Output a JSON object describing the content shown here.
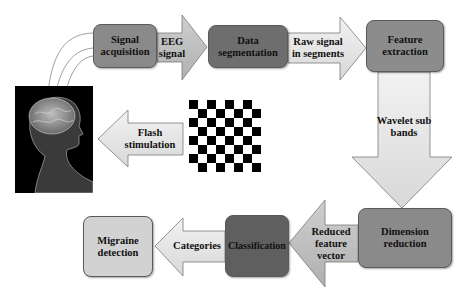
{
  "diagram": {
    "nodes": {
      "signal_acquisition": "Signal acquisition",
      "data_segmentation": "Data segmentation",
      "feature_extraction": "Feature extraction",
      "dimension_reduction": "Dimension reduction",
      "classification": "Classification",
      "migraine_detection": "Migraine detection"
    },
    "arrows": {
      "eeg_signal": "EEG signal",
      "raw_signal": "Raw signal in segments",
      "wavelet": "Wavelet sub bands",
      "reduced_feature": "Reduced feature vector",
      "categories": "Categories",
      "flash": "Flash stimulation"
    },
    "images": {
      "head": "human-head-brain-xray",
      "stimulus": "checkerboard-pattern"
    },
    "colors": {
      "signal_acquisition": "#8a8a8a",
      "data_segmentation": "#6e6e6e",
      "feature_extraction": "#8c8c8c",
      "dimension_reduction": "#8a8a8a",
      "classification": "#5f5f5f",
      "migraine_detection": "#cfcfcf",
      "arrow_mid": "#bdbdbd",
      "arrow_light": "#e2e2e2"
    }
  }
}
